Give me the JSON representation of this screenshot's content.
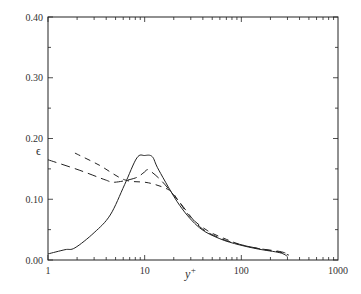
{
  "chart_data": {
    "type": "line",
    "title": "",
    "xlabel": "y+",
    "ylabel": "ε",
    "xscale": "log",
    "xlim": [
      1,
      1000
    ],
    "ylim": [
      0,
      0.4
    ],
    "x_ticks": [
      "1",
      "10",
      "100",
      "1000"
    ],
    "y_ticks": [
      "0.00",
      "0.10",
      "0.20",
      "0.30",
      "0.40"
    ],
    "grid": false,
    "legend": null,
    "series": [
      {
        "name": "solid",
        "style": "solid",
        "x": [
          1,
          1.5,
          1.9,
          3,
          4.4,
          6.2,
          8.3,
          10,
          12,
          14,
          23,
          37,
          60,
          95,
          150,
          250,
          300
        ],
        "y": [
          0.01,
          0.017,
          0.02,
          0.045,
          0.074,
          0.124,
          0.168,
          0.172,
          0.17,
          0.148,
          0.09,
          0.053,
          0.035,
          0.025,
          0.018,
          0.012,
          0.006
        ]
      },
      {
        "name": "long-dash",
        "style": "long-dash",
        "x": [
          1,
          2.1,
          3.9,
          4.9,
          8,
          10,
          11,
          15,
          23,
          37,
          60,
          95,
          150,
          250,
          300
        ],
        "y": [
          0.165,
          0.148,
          0.132,
          0.128,
          0.135,
          0.145,
          0.148,
          0.13,
          0.095,
          0.055,
          0.036,
          0.026,
          0.019,
          0.014,
          0.01
        ]
      },
      {
        "name": "short-dash",
        "style": "short-dash",
        "x": [
          1.9,
          3.4,
          6.2,
          11,
          18,
          22,
          30,
          45,
          70,
          100,
          160,
          250,
          310
        ],
        "y": [
          0.176,
          0.156,
          0.132,
          0.127,
          0.115,
          0.099,
          0.07,
          0.048,
          0.034,
          0.025,
          0.018,
          0.013,
          0.008
        ]
      }
    ]
  },
  "axis": {
    "xlabel": "y",
    "xlabel_sup": "+",
    "ylabel": "ϵ"
  }
}
